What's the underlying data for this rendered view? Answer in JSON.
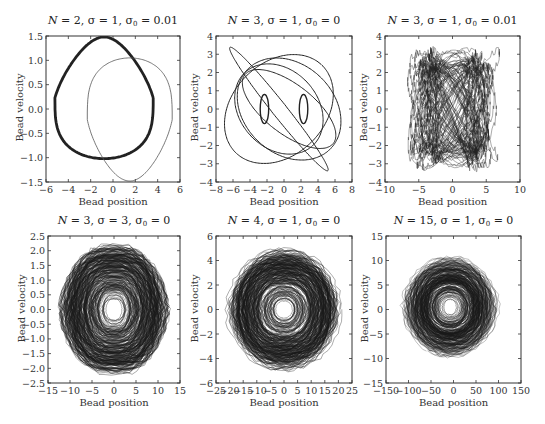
{
  "figure": {
    "panels": [
      {
        "id": "p1",
        "title": {
          "N": "2",
          "sigma": "1",
          "sigma0": "0.01"
        },
        "xlabel": "Bead position",
        "ylabel": "Bead velocity",
        "xticks": [
          "−6",
          "−4",
          "−2",
          "0",
          "2",
          "4",
          "6"
        ],
        "yticks": [
          "1.5",
          "1.0",
          "0.5",
          "0.0",
          "−0.5",
          "−1.0",
          "−1.5"
        ]
      },
      {
        "id": "p2",
        "title": {
          "N": "3",
          "sigma": "1",
          "sigma0": "0"
        },
        "xlabel": "Bead position",
        "ylabel": "Bead velocity",
        "xticks": [
          "−8",
          "−6",
          "−4",
          "−2",
          "0",
          "2",
          "4",
          "6",
          "8"
        ],
        "yticks": [
          "4",
          "3",
          "2",
          "1",
          "0",
          "−1",
          "−2",
          "−3",
          "−4"
        ]
      },
      {
        "id": "p3",
        "title": {
          "N": "3",
          "sigma": "1",
          "sigma0": "0.01"
        },
        "xlabel": "Bead position",
        "ylabel": "Bead velocity",
        "xticks": [
          "−10",
          "−5",
          "0",
          "5",
          "10"
        ],
        "yticks": [
          "4",
          "3",
          "2",
          "1",
          "0",
          "−1",
          "−2",
          "−3",
          "−4"
        ]
      },
      {
        "id": "p4",
        "title": {
          "N": "3",
          "sigma": "3",
          "sigma0": "0"
        },
        "xlabel": "Bead position",
        "ylabel": "Bead velocity",
        "xticks": [
          "−15",
          "−10",
          "−5",
          "0",
          "5",
          "10",
          "15"
        ],
        "yticks": [
          "2.5",
          "2.0",
          "1.5",
          "1.0",
          "0.5",
          "0.0",
          "−0.5",
          "−1.0",
          "−1.5",
          "−2.0",
          "−2.5"
        ]
      },
      {
        "id": "p5",
        "title": {
          "N": "4",
          "sigma": "1",
          "sigma0": "0"
        },
        "xlabel": "Bead position",
        "ylabel": "Bead velocity",
        "xticks": [
          "−25",
          "−20",
          "−15",
          "−10",
          "−5",
          "0",
          "5",
          "10",
          "15",
          "20",
          "25"
        ],
        "yticks": [
          "6",
          "4",
          "2",
          "0",
          "−2",
          "−4",
          "−6"
        ]
      },
      {
        "id": "p6",
        "title": {
          "N": "15",
          "sigma": "1",
          "sigma0": "0"
        },
        "xlabel": "Bead position",
        "ylabel": "Bead velocity",
        "xticks": [
          "−150",
          "−100",
          "−50",
          "0",
          "50",
          "100",
          "150"
        ],
        "yticks": [
          "15",
          "10",
          "5",
          "0",
          "−5",
          "−10",
          "−15"
        ]
      }
    ]
  },
  "chart_data": [
    {
      "type": "line",
      "title": "N = 2, σ = 1, σ0 = 0.01",
      "xlabel": "Bead position",
      "ylabel": "Bead velocity",
      "xlim": [
        -6,
        6
      ],
      "ylim": [
        -1.5,
        1.5
      ],
      "grid": false,
      "series": [
        {
          "name": "thick closed orbit",
          "x_range": [
            -5.2,
            3.6
          ],
          "y_range": [
            -1.02,
            1.48
          ],
          "linewidth": "thick"
        },
        {
          "name": "thin closed orbit",
          "x_range": [
            -2.4,
            5.3
          ],
          "y_range": [
            -1.48,
            1.05
          ],
          "linewidth": "thin"
        }
      ]
    },
    {
      "type": "line",
      "title": "N = 3, σ = 1, σ0 = 0",
      "xlabel": "Bead position",
      "ylabel": "Bead velocity",
      "xlim": [
        -8,
        8
      ],
      "ylim": [
        -4,
        4
      ],
      "grid": false,
      "series": [
        {
          "name": "quasi-periodic orbit",
          "x_range": [
            -6.5,
            6.5
          ],
          "y_range": [
            -3.3,
            3.3
          ]
        }
      ]
    },
    {
      "type": "line",
      "title": "N = 3, σ = 1, σ0 = 0.01",
      "xlabel": "Bead position",
      "ylabel": "Bead velocity",
      "xlim": [
        -10,
        10
      ],
      "ylim": [
        -4,
        4
      ],
      "grid": false,
      "series": [
        {
          "name": "dense torus orbit",
          "x_range": [
            -6.5,
            6.5
          ],
          "y_range": [
            -3.3,
            3.3
          ]
        }
      ]
    },
    {
      "type": "line",
      "title": "N = 3, σ = 3, σ0 = 0",
      "xlabel": "Bead position",
      "ylabel": "Bead velocity",
      "xlim": [
        -15,
        15
      ],
      "ylim": [
        -2.5,
        2.5
      ],
      "grid": false,
      "series": [
        {
          "name": "chaotic orbit",
          "x_range": [
            -13.5,
            13.5
          ],
          "y_range": [
            -2.4,
            2.4
          ]
        }
      ]
    },
    {
      "type": "line",
      "title": "N = 4, σ = 1, σ0 = 0",
      "xlabel": "Bead position",
      "ylabel": "Bead velocity",
      "xlim": [
        -25,
        25
      ],
      "ylim": [
        -6,
        6
      ],
      "grid": false,
      "series": [
        {
          "name": "chaotic orbit",
          "x_range": [
            -22,
            22
          ],
          "y_range": [
            -5.3,
            5.3
          ]
        }
      ]
    },
    {
      "type": "line",
      "title": "N = 15, σ = 1, σ0 = 0",
      "xlabel": "Bead position",
      "ylabel": "Bead velocity",
      "xlim": [
        -150,
        150
      ],
      "ylim": [
        -15,
        15
      ],
      "grid": false,
      "series": [
        {
          "name": "chaotic orbit",
          "x_range": [
            -120,
            105
          ],
          "y_range": [
            -10.5,
            11.5
          ]
        }
      ]
    }
  ]
}
